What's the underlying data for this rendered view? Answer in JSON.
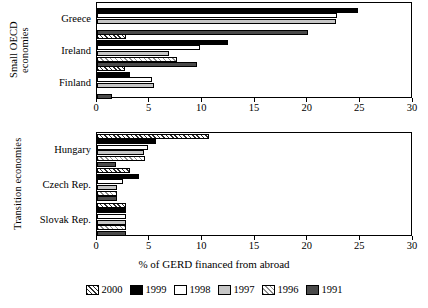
{
  "chart_data": {
    "type": "bar",
    "orientation": "horizontal",
    "title": "",
    "xlabel": "% of GERD financed from abroad",
    "ylabel": "",
    "xlim": [
      0,
      30
    ],
    "xticks": [
      0,
      5,
      10,
      15,
      20,
      25,
      30
    ],
    "grid": false,
    "legend_position": "bottom",
    "legend": [
      "2000",
      "1999",
      "1998",
      "1997",
      "1996",
      "1991"
    ],
    "series_styles": {
      "2000": "diagonal-hatch-dark",
      "1999": "solid-black",
      "1998": "solid-white",
      "1997": "solid-light-gray",
      "1996": "diagonal-hatch-light",
      "1991": "solid-dark-gray"
    },
    "panels": [
      {
        "group_label": "Small OECD\neconomies",
        "categories": [
          "Greece",
          "Ireland",
          "Finland"
        ],
        "series": [
          {
            "name": "2000",
            "values": [
              null,
              2.8,
              2.7
            ]
          },
          {
            "name": "1999",
            "values": [
              24.8,
              12.4,
              3.1
            ]
          },
          {
            "name": "1998",
            "values": [
              22.8,
              9.8,
              5.2
            ]
          },
          {
            "name": "1997",
            "values": [
              22.7,
              6.8,
              5.4
            ]
          },
          {
            "name": "1996",
            "values": [
              null,
              7.6,
              null
            ]
          },
          {
            "name": "1991",
            "values": [
              20.0,
              9.5,
              1.4
            ]
          }
        ]
      },
      {
        "group_label": "Transition economies",
        "categories": [
          "Hungary",
          "Czech Rep.",
          "Slovak Rep."
        ],
        "series": [
          {
            "name": "2000",
            "values": [
              10.6,
              3.1,
              2.8
            ]
          },
          {
            "name": "1999",
            "values": [
              5.6,
              4.0,
              2.8
            ]
          },
          {
            "name": "1998",
            "values": [
              4.8,
              2.5,
              2.8
            ]
          },
          {
            "name": "1997",
            "values": [
              4.5,
              1.9,
              2.8
            ]
          },
          {
            "name": "1996",
            "values": [
              4.6,
              1.9,
              2.8
            ]
          },
          {
            "name": "1991",
            "values": [
              1.8,
              1.9,
              2.8
            ]
          }
        ]
      }
    ]
  },
  "panel_top": {
    "group_title": "Small OECD\neconomies",
    "categories": [
      "Greece",
      "Ireland",
      "Finland"
    ]
  },
  "panel_bottom": {
    "group_title": "Transition economies",
    "categories": [
      "Hungary",
      "Czech Rep.",
      "Slovak Rep."
    ]
  },
  "axis": {
    "xlabel": "% of GERD financed from abroad",
    "ticks": [
      "0",
      "5",
      "10",
      "15",
      "20",
      "25",
      "30"
    ]
  },
  "legend": {
    "items": [
      {
        "label": "2000"
      },
      {
        "label": "1999"
      },
      {
        "label": "1998"
      },
      {
        "label": "1997"
      },
      {
        "label": "1996"
      },
      {
        "label": "1991"
      }
    ]
  }
}
